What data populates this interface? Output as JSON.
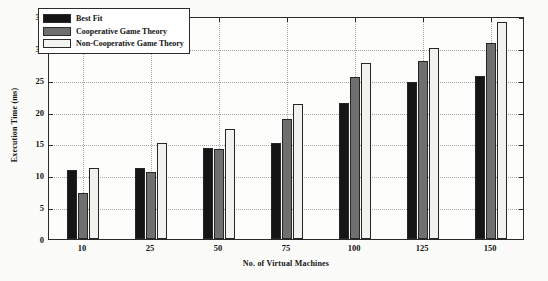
{
  "chart_data": {
    "type": "bar",
    "title": "",
    "xlabel": "No. of Virtual Machines",
    "ylabel": "Execution Time (ms)",
    "categories": [
      "10",
      "25",
      "50",
      "75",
      "100",
      "125",
      "150"
    ],
    "series": [
      {
        "name": "Best Fit",
        "color": "#151515",
        "values": [
          10.8,
          11.2,
          14.3,
          15.1,
          21.3,
          24.6,
          25.6
        ]
      },
      {
        "name": "Cooperative Game Theory",
        "color": "#6f6f6f",
        "values": [
          7.3,
          10.5,
          14.2,
          18.9,
          25.4,
          27.9,
          30.7
        ]
      },
      {
        "name": "Non-Cooperative Game Theory",
        "color": "#f2f2ef",
        "values": [
          11.2,
          15.1,
          17.2,
          21.2,
          27.6,
          30.0,
          34.1
        ]
      }
    ],
    "ylim": [
      0,
      35
    ],
    "yticks": [
      0,
      5,
      10,
      15,
      20,
      25,
      30,
      35
    ],
    "ytick_labels": [
      "0",
      "5",
      "10",
      "15",
      "20",
      "25",
      "30",
      "35"
    ],
    "grid": true,
    "grid_style": "dotted",
    "legend_position": "top-left",
    "frame": true
  },
  "legend": {
    "entries": [
      {
        "label": "Best Fit"
      },
      {
        "label": "Cooperative Game Theory"
      },
      {
        "label": "Non-Cooperative Game Theory"
      }
    ]
  }
}
